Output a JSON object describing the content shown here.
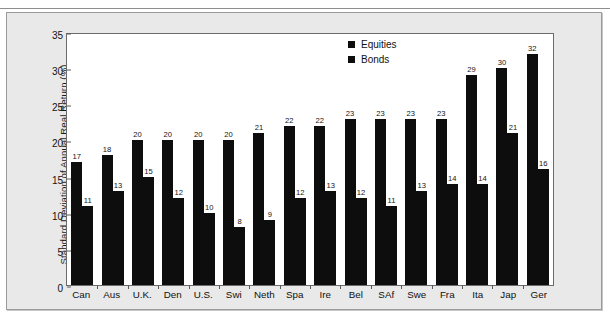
{
  "chart_data": {
    "type": "bar",
    "title": "",
    "subtitle": "",
    "xlabel": "",
    "ylabel": "Standard Deviation of Annual Real Return (%)",
    "ylim": [
      0,
      35
    ],
    "yticks": [
      0,
      5,
      10,
      15,
      20,
      25,
      30,
      35
    ],
    "grid": false,
    "legend_position": "top-right",
    "categories": [
      "Can",
      "Aus",
      "U.K.",
      "Den",
      "U.S.",
      "Swi",
      "Neth",
      "Spa",
      "Ire",
      "Bel",
      "SAf",
      "Swe",
      "Fra",
      "Ita",
      "Jap",
      "Ger"
    ],
    "series": [
      {
        "name": "Equities",
        "color": "#0d0d0d",
        "values": [
          17,
          18,
          20,
          20,
          20,
          20,
          21,
          22,
          22,
          23,
          23,
          23,
          23,
          29,
          30,
          32
        ]
      },
      {
        "name": "Bonds",
        "color": "#0d0d0d",
        "values": [
          11,
          13,
          15,
          12,
          10,
          8,
          9,
          12,
          13,
          12,
          11,
          13,
          14,
          14,
          21,
          16
        ]
      }
    ]
  },
  "legend": {
    "items": [
      {
        "label": "Equities",
        "color": "#0d0d0d"
      },
      {
        "label": "Bonds",
        "color": "#0d0d0d"
      }
    ]
  },
  "axes": {
    "y_title": "Standard Deviation of Annual Real Return (%)",
    "y_ticks": [
      "0",
      "5",
      "10",
      "15",
      "20",
      "25",
      "30",
      "35"
    ]
  },
  "colors": {
    "bar": "#0d0d0d",
    "page_background": "#e9e9e9",
    "plot_background": "#ffffff",
    "axis_line": "#6b6b6b",
    "text": "#111111"
  }
}
